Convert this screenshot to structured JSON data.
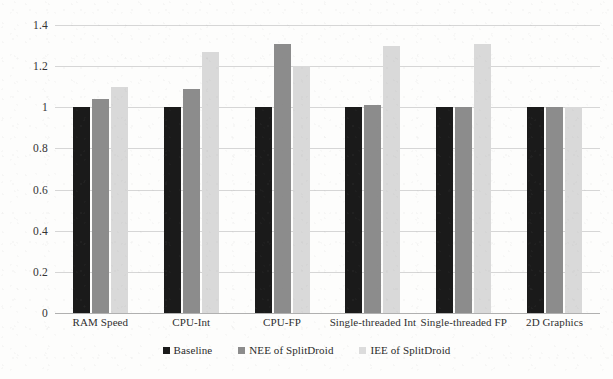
{
  "chart_data": {
    "type": "bar",
    "title": "",
    "subtitle": "",
    "xlabel": "",
    "ylabel": "",
    "ylim": [
      0,
      1.4
    ],
    "yticks": [
      "0",
      "0.2",
      "0.4",
      "0.6",
      "0.8",
      "1",
      "1.2",
      "1.4"
    ],
    "ytick_values": [
      0,
      0.2,
      0.4,
      0.6,
      0.8,
      1,
      1.2,
      1.4
    ],
    "grid": true,
    "legend_position": "bottom-center",
    "categories": [
      "RAM Speed",
      "CPU-Int",
      "CPU-FP",
      "Single-threaded Int",
      "Single-threaded FP",
      "2D Graphics"
    ],
    "series": [
      {
        "name": "Baseline",
        "color": "#1a1a1a",
        "values": [
          1.0,
          1.0,
          1.0,
          1.0,
          1.0,
          1.0
        ]
      },
      {
        "name": "NEE of SplitDroid",
        "color": "#8c8c8c",
        "values": [
          1.04,
          1.09,
          1.31,
          1.01,
          1.0,
          1.0
        ]
      },
      {
        "name": "IEE of SplitDroid",
        "color": "#d9d9d9",
        "values": [
          1.1,
          1.27,
          1.2,
          1.3,
          1.31,
          1.0
        ]
      }
    ]
  },
  "axis": {
    "y_tick_labels": [
      "1.4",
      "1.2",
      "1",
      "0.8",
      "0.6",
      "0.4",
      "0.2",
      "0"
    ],
    "x_tick_labels": [
      "RAM Speed",
      "CPU-Int",
      "CPU-FP",
      "Single-threaded Int",
      "Single-threaded FP",
      "2D Graphics"
    ]
  },
  "legend": {
    "items": [
      {
        "label": "Baseline",
        "color": "#1a1a1a"
      },
      {
        "label": "NEE of SplitDroid",
        "color": "#8c8c8c"
      },
      {
        "label": "IEE of SplitDroid",
        "color": "#dcdcdc"
      }
    ]
  },
  "colors": {
    "baseline": "#1a1a1a",
    "nee": "#8c8c8c",
    "iee": "#d9d9d9",
    "gridline": "#d6d6d6",
    "axis": "#b0b0b0",
    "text": "#2b2b2b",
    "page_background": "#fdfdfc"
  }
}
